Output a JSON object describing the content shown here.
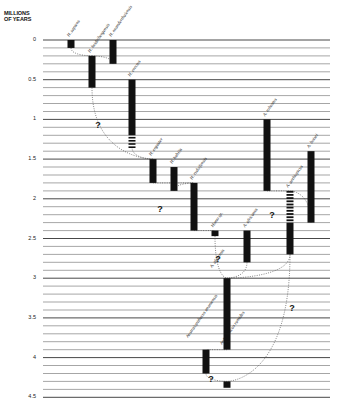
{
  "axis": {
    "title_line1": "MILLIONS",
    "title_line2": "OF YEARS",
    "ticks": [
      {
        "label": "0",
        "value": 0
      },
      {
        "label": "0.5",
        "value": 0.5
      },
      {
        "label": "1",
        "value": 1
      },
      {
        "label": "1.5",
        "value": 1.5
      },
      {
        "label": "2",
        "value": 2
      },
      {
        "label": "2.5",
        "value": 2.5
      },
      {
        "label": "3",
        "value": 3
      },
      {
        "label": "3.5",
        "value": 3.5
      },
      {
        "label": "4",
        "value": 4
      },
      {
        "label": "4.5",
        "value": 4.5
      }
    ],
    "min": 0,
    "max": 4.5,
    "minor_step": 0.1
  },
  "species": [
    {
      "id": "sapiens",
      "label": "H. sapiens",
      "x": 71,
      "start": 0,
      "end": 0.1,
      "hatched_end": null
    },
    {
      "id": "heidelbergensis",
      "label": "H. heidelbergensis",
      "x": 92,
      "start": 0.2,
      "end": 0.6,
      "hatched_end": null
    },
    {
      "id": "neanderthalensis",
      "label": "H. neanderthalensis",
      "x": 113,
      "start": 0,
      "end": 0.3,
      "hatched_end": null
    },
    {
      "id": "erectus",
      "label": "H. erectus",
      "x": 132,
      "start": 0.5,
      "end": 1.2,
      "hatched_end": 1.35
    },
    {
      "id": "ergaster",
      "label": "H. ergaster",
      "x": 153,
      "start": 1.5,
      "end": 1.8,
      "hatched_end": null
    },
    {
      "id": "habilis",
      "label": "H. habilis",
      "x": 174,
      "start": 1.6,
      "end": 1.9,
      "hatched_end": null
    },
    {
      "id": "rudolfensis",
      "label": "H. rudolfensis",
      "x": 194,
      "start": 1.8,
      "end": 2.4,
      "hatched_end": null
    },
    {
      "id": "homo-sp",
      "label": "Homo sp.",
      "x": 215,
      "start": 2.4,
      "end": 2.47,
      "hatched_end": null
    },
    {
      "id": "africanus",
      "label": "A. africanus",
      "x": 247,
      "start": 2.4,
      "end": 2.8,
      "hatched_end": null
    },
    {
      "id": "afarensis",
      "label": "A. afarensis",
      "x": 227,
      "start": 3.0,
      "end": 3.9,
      "hatched_end": null
    },
    {
      "id": "robustus",
      "label": "A. robustus",
      "x": 267,
      "start": 1.0,
      "end": 1.9,
      "hatched_end": null
    },
    {
      "id": "aethiopicus",
      "label": "A. aethiopicus",
      "x": 290,
      "start": 1.9,
      "end": 2.7,
      "hatched_end": null,
      "hatched_start": 1.9,
      "solid_start": 2.3
    },
    {
      "id": "boisei",
      "label": "A. boisei",
      "x": 311,
      "start": 1.4,
      "end": 2.3,
      "hatched_end": null
    },
    {
      "id": "anamensis",
      "label": "Australopithecus anamensis",
      "x": 206,
      "start": 3.9,
      "end": 4.2,
      "hatched_end": null
    },
    {
      "id": "ramidus",
      "label": "Ardipithecus ramidus",
      "x": 227,
      "start": 4.3,
      "end": 4.38,
      "hatched_end": null
    }
  ],
  "uncertainty_marks": [
    {
      "label": "?",
      "x": 98,
      "y": 128
    },
    {
      "label": "?",
      "x": 160,
      "y": 212
    },
    {
      "label": "?",
      "x": 218,
      "y": 262
    },
    {
      "label": "?",
      "x": 272,
      "y": 218
    },
    {
      "label": "?",
      "x": 292,
      "y": 311
    },
    {
      "label": "?",
      "x": 211,
      "y": 382
    }
  ],
  "colors": {
    "bar": "#111111",
    "grid": "#6a6a6a",
    "grid_major": "#333333",
    "link": "#555555"
  }
}
